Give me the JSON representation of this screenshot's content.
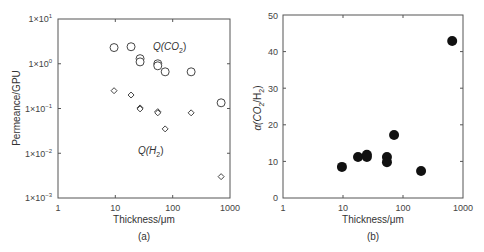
{
  "chart_data": [
    {
      "id": "a",
      "type": "scatter",
      "title": "",
      "caption": "(a)",
      "xlabel": "Thickness/μm",
      "ylabel": "Permeance/GPU",
      "xscale": "log",
      "yscale": "log",
      "xlim": [
        1,
        1000
      ],
      "ylim": [
        0.001,
        10
      ],
      "xticks": [
        "1",
        "10",
        "100",
        "1000"
      ],
      "yticks": [
        "1×10⁻³",
        "1×10⁻²",
        "1×10⁻¹",
        "1×10⁰",
        "1×10¹"
      ],
      "grid": false,
      "legend": null,
      "annotations": [
        {
          "text": "Q(CO₂)",
          "series": "CO2"
        },
        {
          "text": "Q(H₂)",
          "series": "H2"
        }
      ],
      "series": [
        {
          "name": "Q(CO2)",
          "marker": "open-circle",
          "x": [
            9.5,
            18.8,
            27,
            27,
            55,
            55,
            74,
            210,
            700
          ],
          "y": [
            2.3,
            2.4,
            1.3,
            1.1,
            1.0,
            0.9,
            0.66,
            0.66,
            0.134
          ]
        },
        {
          "name": "Q(H2)",
          "marker": "open-diamond",
          "x": [
            9.5,
            18.8,
            27,
            27,
            55,
            55,
            74,
            210,
            700
          ],
          "y": [
            0.25,
            0.2,
            0.103,
            0.098,
            0.085,
            0.08,
            0.035,
            0.08,
            0.003
          ]
        }
      ]
    },
    {
      "id": "b",
      "type": "scatter",
      "title": "",
      "caption": "(b)",
      "xlabel": "Thickness/μm",
      "ylabel": "α(CO₂/H₂)",
      "xscale": "log",
      "yscale": "linear",
      "xlim": [
        1,
        1000
      ],
      "ylim": [
        0,
        50
      ],
      "xticks": [
        "1",
        "10",
        "100",
        "1000"
      ],
      "yticks": [
        "0",
        "10",
        "20",
        "30",
        "40",
        "50"
      ],
      "grid": false,
      "legend": null,
      "series": [
        {
          "name": "alpha(CO2/H2)",
          "marker": "filled-circle",
          "x": [
            9.6,
            17.8,
            25,
            25,
            54,
            54,
            71,
            200,
            660
          ],
          "y": [
            8.5,
            11.2,
            11.8,
            11.2,
            11.2,
            9.8,
            17.2,
            7.4,
            42.9
          ]
        }
      ]
    }
  ],
  "labels": {
    "a": {
      "ylabel": "Permeance/GPU",
      "xlabel": "Thickness/μm",
      "caption": "(a)",
      "annot_co2_main": "Q(CO",
      "annot_co2_sub": "2",
      "annot_co2_end": ")",
      "annot_h2_main": "Q(H",
      "annot_h2_sub": "2",
      "annot_h2_end": ")",
      "yt0_base": "1×10",
      "yt0_exp": "1",
      "yt1_base": "1×10",
      "yt1_exp": "0",
      "yt2_base": "1×10",
      "yt2_exp": "−1",
      "yt3_base": "1×10",
      "yt3_exp": "−2",
      "yt4_base": "1×10",
      "yt4_exp": "−3",
      "xt0": "1",
      "xt1": "10",
      "xt2": "100",
      "xt3": "1000"
    },
    "b": {
      "ylabel_a": "α(CO",
      "ylabel_s1": "2",
      "ylabel_m": "/H",
      "ylabel_s2": "2",
      "ylabel_e": ")",
      "xlabel": "Thickness/μm",
      "caption": "(b)",
      "yt0": "0",
      "yt1": "10",
      "yt2": "20",
      "yt3": "30",
      "yt4": "40",
      "yt5": "50",
      "xt0": "1",
      "xt1": "10",
      "xt2": "100",
      "xt3": "1000"
    }
  },
  "colors": {
    "axis": "#555555",
    "marker_stroke": "#444444",
    "marker_fill_b": "#111111",
    "text": "#333333"
  }
}
